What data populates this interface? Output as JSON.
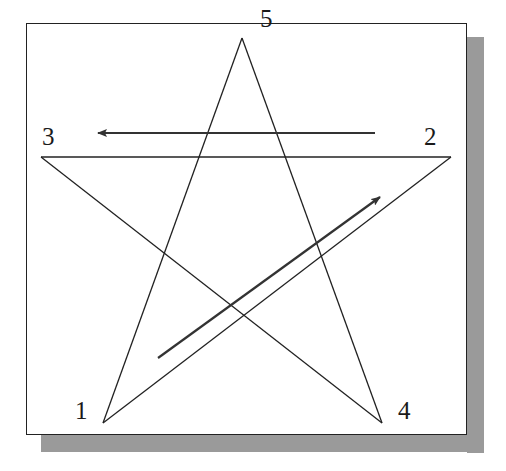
{
  "diagram": {
    "vertices": [
      {
        "id": "1",
        "label": "1",
        "x": 103,
        "y": 423,
        "label_x": 75,
        "label_y": 398
      },
      {
        "id": "2",
        "label": "2",
        "x": 451,
        "y": 157,
        "label_x": 424,
        "label_y": 124
      },
      {
        "id": "3",
        "label": "3",
        "x": 41,
        "y": 157,
        "label_x": 42,
        "label_y": 124
      },
      {
        "id": "4",
        "label": "4",
        "x": 382,
        "y": 423,
        "label_x": 398,
        "label_y": 398
      },
      {
        "id": "5",
        "label": "5",
        "x": 242,
        "y": 38,
        "label_x": 260,
        "label_y": 6
      }
    ],
    "edges": [
      {
        "from": "1",
        "to": "2"
      },
      {
        "from": "2",
        "to": "3"
      },
      {
        "from": "3",
        "to": "4"
      },
      {
        "from": "4",
        "to": "5"
      },
      {
        "from": "5",
        "to": "1"
      }
    ],
    "arrows": [
      {
        "name": "direction-arrow-2-to-3",
        "x1": 375,
        "y1": 133,
        "x2": 98,
        "y2": 133
      },
      {
        "name": "direction-arrow-1-to-2",
        "x1": 158,
        "y1": 358,
        "x2": 380,
        "y2": 197
      }
    ],
    "colors": {
      "line": "#222222",
      "arrow": "#333333",
      "frame": "#222222",
      "shadow": "#9a9a9a",
      "background": "#ffffff"
    }
  }
}
